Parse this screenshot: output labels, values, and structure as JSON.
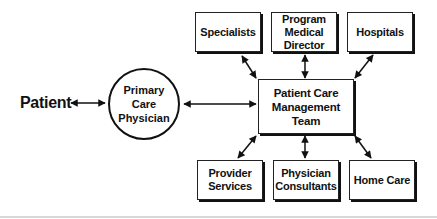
{
  "diagram": {
    "type": "hub-and-spoke flow",
    "patient_label": "Patient",
    "primary_care": "Primary\nCare\nPhysician",
    "hub": "Patient Care\nManagement\nTeam",
    "top_nodes": [
      {
        "label": "Specialists"
      },
      {
        "label": "Program\nMedical\nDirector"
      },
      {
        "label": "Hospitals"
      }
    ],
    "bottom_nodes": [
      {
        "label": "Provider\nServices"
      },
      {
        "label": "Physician\nConsultants"
      },
      {
        "label": "Home Care"
      }
    ],
    "edges": [
      {
        "from": "Patient",
        "to": "Primary Care Physician",
        "direction": "both"
      },
      {
        "from": "Primary Care Physician",
        "to": "Patient Care Management Team",
        "direction": "both"
      },
      {
        "from": "Patient Care Management Team",
        "to": "Specialists",
        "direction": "both"
      },
      {
        "from": "Patient Care Management Team",
        "to": "Program Medical Director",
        "direction": "both"
      },
      {
        "from": "Patient Care Management Team",
        "to": "Hospitals",
        "direction": "both"
      },
      {
        "from": "Patient Care Management Team",
        "to": "Provider Services",
        "direction": "both"
      },
      {
        "from": "Patient Care Management Team",
        "to": "Physician Consultants",
        "direction": "both"
      },
      {
        "from": "Patient Care Management Team",
        "to": "Home Care",
        "direction": "both"
      }
    ],
    "colors": {
      "stroke": "#111111",
      "background": "#ffffff",
      "footer_rule": "#d8d8d8"
    }
  }
}
